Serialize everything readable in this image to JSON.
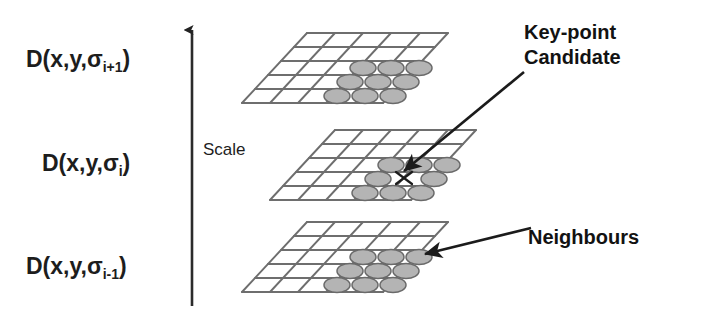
{
  "figure": {
    "background_color": "#ffffff",
    "ink_color": "#1d1d1d",
    "grid_line_color": "#6e6e6e",
    "circle_fill_color": "#b3b3b3",
    "circle_stroke_color": "#6a6a6a"
  },
  "axis": {
    "name": "scale-axis",
    "label": "Scale",
    "direction": "up",
    "arrow_color": "#222222"
  },
  "planes": [
    {
      "id": "plane-top",
      "label": "D(x,y,σ",
      "label_sub": "i+1",
      "label_close": ")",
      "grid_rows": 5,
      "grid_cols": 5,
      "marked_cells": 9,
      "marker_pattern": "3x3 neighbourhood",
      "has_keypoint_x": false
    },
    {
      "id": "plane-middle",
      "label": "D(x,y,σ",
      "label_sub": "i",
      "label_close": ")",
      "grid_rows": 5,
      "grid_cols": 5,
      "marked_cells": 8,
      "marker_pattern": "8 neighbours around centre",
      "has_keypoint_x": true
    },
    {
      "id": "plane-bottom",
      "label": "D(x,y,σ",
      "label_sub": "i-1",
      "label_close": ")",
      "grid_rows": 5,
      "grid_cols": 5,
      "marked_cells": 9,
      "marker_pattern": "3x3 neighbourhood",
      "has_keypoint_x": false
    }
  ],
  "annotations": [
    {
      "id": "keypoint-annotation",
      "line1": "Key-point",
      "line2": "Candidate",
      "arrow_from": [
        524,
        72
      ],
      "arrow_to": [
        402,
        170
      ]
    },
    {
      "id": "neighbours-annotation",
      "line1": "Neighbours",
      "line2": "",
      "arrow_from": [
        531,
        228
      ],
      "arrow_to": [
        423,
        254
      ]
    }
  ]
}
